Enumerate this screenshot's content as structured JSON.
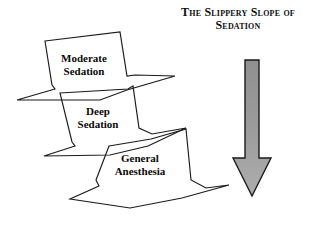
{
  "figure": {
    "title": {
      "lines": [
        "The Slippery Slope of",
        "Sedation"
      ]
    },
    "background_color": "#ffffff",
    "line_color": "#1a1a1a",
    "text_color": "#0a0a0a",
    "slabs": [
      {
        "id": "moderate",
        "line1": "Moderate",
        "line2": "Sedation"
      },
      {
        "id": "deep",
        "line1": "Deep",
        "line2": "Sedation"
      },
      {
        "id": "general",
        "line1": "General",
        "line2": "Anesthesia"
      }
    ],
    "arrow": {
      "direction": "down",
      "fill_top_color": "#8f8f8f",
      "fill_bottom_color": "#a8a8a8",
      "outline_color": "#1a1a1a"
    }
  }
}
